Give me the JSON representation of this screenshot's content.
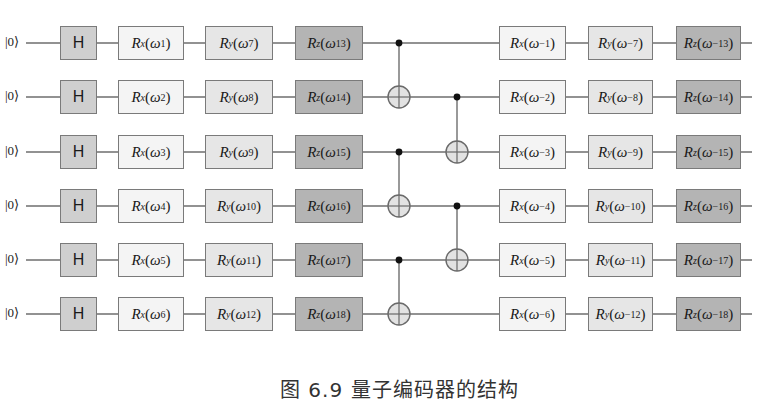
{
  "figure": {
    "caption": "图 6.9   量子编码器的结构",
    "type": "quantum-circuit"
  },
  "qubits": [
    {
      "init": "|0⟩",
      "h": "H",
      "rx": {
        "axis": "x",
        "param": "1"
      },
      "ry": {
        "axis": "y",
        "param": "7"
      },
      "rz": {
        "axis": "z",
        "param": "13"
      },
      "rx_inv": {
        "axis": "x",
        "param": "−1"
      },
      "ry_inv": {
        "axis": "y",
        "param": "−7"
      },
      "rz_inv": {
        "axis": "z",
        "param": "−13"
      }
    },
    {
      "init": "|0⟩",
      "h": "H",
      "rx": {
        "axis": "x",
        "param": "2"
      },
      "ry": {
        "axis": "y",
        "param": "8"
      },
      "rz": {
        "axis": "z",
        "param": "14"
      },
      "rx_inv": {
        "axis": "x",
        "param": "−2"
      },
      "ry_inv": {
        "axis": "y",
        "param": "−8"
      },
      "rz_inv": {
        "axis": "z",
        "param": "−14"
      }
    },
    {
      "init": "|0⟩",
      "h": "H",
      "rx": {
        "axis": "x",
        "param": "3"
      },
      "ry": {
        "axis": "y",
        "param": "9"
      },
      "rz": {
        "axis": "z",
        "param": "15"
      },
      "rx_inv": {
        "axis": "x",
        "param": "−3"
      },
      "ry_inv": {
        "axis": "y",
        "param": "−9"
      },
      "rz_inv": {
        "axis": "z",
        "param": "−15"
      }
    },
    {
      "init": "|0⟩",
      "h": "H",
      "rx": {
        "axis": "x",
        "param": "4"
      },
      "ry": {
        "axis": "y",
        "param": "10"
      },
      "rz": {
        "axis": "z",
        "param": "16"
      },
      "rx_inv": {
        "axis": "x",
        "param": "−4"
      },
      "ry_inv": {
        "axis": "y",
        "param": "−10"
      },
      "rz_inv": {
        "axis": "z",
        "param": "−16"
      }
    },
    {
      "init": "|0⟩",
      "h": "H",
      "rx": {
        "axis": "x",
        "param": "5"
      },
      "ry": {
        "axis": "y",
        "param": "11"
      },
      "rz": {
        "axis": "z",
        "param": "17"
      },
      "rx_inv": {
        "axis": "x",
        "param": "−5"
      },
      "ry_inv": {
        "axis": "y",
        "param": "−11"
      },
      "rz_inv": {
        "axis": "z",
        "param": "−17"
      }
    },
    {
      "init": "|0⟩",
      "h": "H",
      "rx": {
        "axis": "x",
        "param": "6"
      },
      "ry": {
        "axis": "y",
        "param": "12"
      },
      "rz": {
        "axis": "z",
        "param": "18"
      },
      "rx_inv": {
        "axis": "x",
        "param": "−6"
      },
      "ry_inv": {
        "axis": "y",
        "param": "−12"
      },
      "rz_inv": {
        "axis": "z",
        "param": "−18"
      }
    }
  ],
  "gate_symbols": {
    "rotation": "R",
    "angle": "ω",
    "control": "control-dot",
    "target": "xor-plus"
  },
  "cnot_layers": [
    {
      "x": 399,
      "pairs": [
        {
          "control": 0,
          "target": 1
        },
        {
          "control": 2,
          "target": 3
        },
        {
          "control": 4,
          "target": 5
        }
      ]
    },
    {
      "x": 457,
      "pairs": [
        {
          "control": 1,
          "target": 2
        },
        {
          "control": 3,
          "target": 4
        }
      ]
    }
  ],
  "colors": {
    "wire": "#6e6e6e",
    "h_fill": "#cfcfcf",
    "rx_fill": "#f4f4f4",
    "ry_fill": "#e6e6e6",
    "rz_fill": "#b4b4b4",
    "target_fill": "#e2e2e2"
  }
}
